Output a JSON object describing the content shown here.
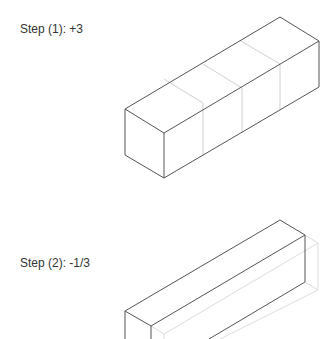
{
  "steps": [
    {
      "label": "Step (1): +3"
    },
    {
      "label": "Step (2): -1/3"
    }
  ],
  "colors": {
    "edge": "#555555",
    "faint_edge": "#d0d0d0",
    "text": "#333333"
  }
}
